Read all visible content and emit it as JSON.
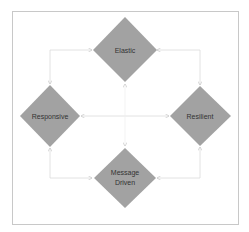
{
  "diagram": {
    "type": "reactive-manifesto",
    "colors": {
      "frame": "#c8c8c8",
      "node_fill": "#a2a2a2",
      "connector": "#d6d6d6",
      "arrow": "#cfcfcf",
      "text": "#333333"
    },
    "nodes": {
      "elastic": {
        "label": "Elastic"
      },
      "responsive": {
        "label": "Responsive"
      },
      "resilient": {
        "label": "Resilient"
      },
      "message_driven": {
        "line1": "Message",
        "line2": "Driven"
      }
    },
    "edges": [
      {
        "from": "elastic",
        "to": "responsive"
      },
      {
        "from": "elastic",
        "to": "resilient"
      },
      {
        "from": "responsive",
        "to": "resilient"
      },
      {
        "from": "message_driven",
        "to": "responsive"
      },
      {
        "from": "message_driven",
        "to": "resilient"
      },
      {
        "from": "message_driven",
        "to": "elastic"
      }
    ]
  }
}
